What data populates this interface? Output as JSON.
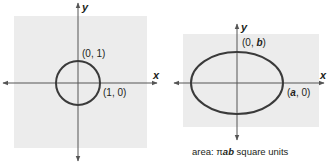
{
  "figures": [
    {
      "id": "unit-circle",
      "shape": "circle",
      "background": "#ececec",
      "curve_color": "#3a3a3a",
      "axis_color": "#555555",
      "axes": {
        "x_label": "x",
        "y_label": "y"
      },
      "points": [
        {
          "label": "(0, 1)",
          "prefix": "(0, ",
          "var": "1",
          "suffix": ")"
        },
        {
          "label": "(1, 0)",
          "prefix": "(1, 0)",
          "var": "",
          "suffix": ""
        }
      ]
    },
    {
      "id": "ellipse",
      "shape": "ellipse",
      "background": "#ececec",
      "curve_color": "#3a3a3a",
      "axis_color": "#555555",
      "axes": {
        "x_label": "x",
        "y_label": "y"
      },
      "points": [
        {
          "label": "(0, b)",
          "prefix": "(0, ",
          "var": "b",
          "suffix": ")"
        },
        {
          "label": "(a, 0)",
          "prefix": "(",
          "var": "a",
          "suffix": ", 0)"
        }
      ],
      "caption": {
        "prefix": "area: ",
        "pi": "π",
        "vars": "ab",
        "suffix": " square units"
      }
    }
  ]
}
